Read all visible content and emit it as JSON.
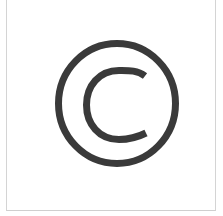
{
  "image": {
    "symbol": "copyright-symbol",
    "label": "©",
    "colors": {
      "background": "#ffffff",
      "symbol": "#3a3a3a",
      "frame": "#d4d4d4"
    }
  }
}
